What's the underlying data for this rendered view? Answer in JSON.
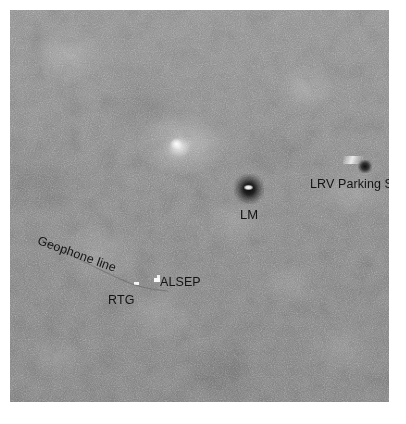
{
  "image": {
    "kind": "lunar-orbital-photograph",
    "subject": "Apollo landing site annotated from orbit",
    "surface_tone_hex": "#8b8b8b",
    "border": "white page margin surrounding the photo plate"
  },
  "annotations": [
    {
      "id": "lm",
      "label": "LM",
      "feature": "dark-halo-with-bright-center",
      "x": 239,
      "y": 179
    },
    {
      "id": "lrv",
      "label": "LRV Parking Spot",
      "feature": "dark-blob-with-track-streak",
      "x": 355,
      "y": 156
    },
    {
      "id": "alsep",
      "label": "ALSEP",
      "feature": "bright-speck",
      "x": 147,
      "y": 270
    },
    {
      "id": "rtg",
      "label": "RTG",
      "feature": "bright-speck",
      "x": 126,
      "y": 273
    },
    {
      "id": "geophone",
      "label": "Geophone line",
      "feature": "curved-trace",
      "x": 95,
      "y": 252,
      "rotation_deg": 20
    }
  ],
  "features": [
    {
      "id": "bright-crater",
      "name": "bright fresh crater",
      "x": 168,
      "y": 137
    }
  ],
  "colors": {
    "label_text_hex": "#141414",
    "page_background_hex": "#ffffff",
    "regolith_light_hex": "#a6a6a6",
    "regolith_dark_hex": "#6e6e6e"
  }
}
